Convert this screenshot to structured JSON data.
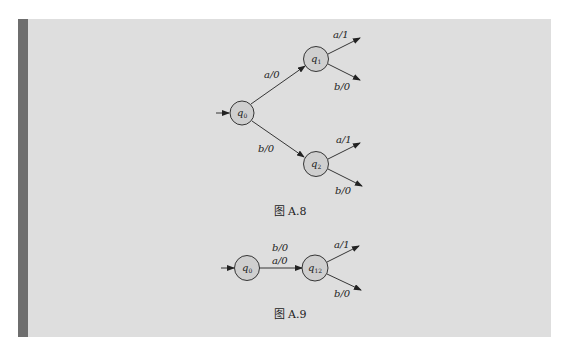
{
  "figures": [
    {
      "caption": "图 A.8",
      "states": [
        {
          "id": "q0",
          "name": "q",
          "sub": "0",
          "initial": true
        },
        {
          "id": "q1",
          "name": "q",
          "sub": "1"
        },
        {
          "id": "q2",
          "name": "q",
          "sub": "2"
        }
      ],
      "transitions": [
        {
          "from": "q0",
          "to": "q1",
          "label": "a/0"
        },
        {
          "from": "q0",
          "to": "q2",
          "label": "b/0"
        },
        {
          "from": "q1",
          "to": "",
          "label": "a/1"
        },
        {
          "from": "q1",
          "to": "",
          "label": "b/0"
        },
        {
          "from": "q2",
          "to": "",
          "label": "a/1"
        },
        {
          "from": "q2",
          "to": "",
          "label": "b/0"
        }
      ]
    },
    {
      "caption": "图 A.9",
      "states": [
        {
          "id": "q0",
          "name": "q",
          "sub": "0",
          "initial": true
        },
        {
          "id": "q12",
          "name": "q",
          "sub": "12"
        }
      ],
      "transitions": [
        {
          "from": "q0",
          "to": "q12",
          "label_top": "b/0",
          "label_bottom": "a/0"
        },
        {
          "from": "q12",
          "to": "",
          "label": "a/1"
        },
        {
          "from": "q12",
          "to": "",
          "label": "b/0"
        }
      ]
    }
  ],
  "colors": {
    "panel_bg": "#dedede",
    "side_bar": "#6e6e6e",
    "state_fill": "#cfcfcf",
    "stroke": "#222222"
  }
}
